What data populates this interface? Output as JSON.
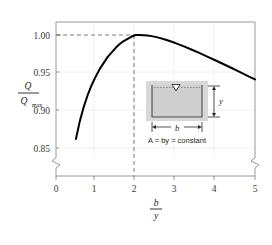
{
  "figure": {
    "caption": "(a)",
    "background_color": "#ffffff",
    "curve_color": "#000000",
    "frame_color": "#9a9a9a",
    "grid_color": "#e8e8e8",
    "dash_color": "#6e6e6e"
  },
  "axes": {
    "y_title_numerator": "Q",
    "y_title_denominator": "Q",
    "y_title_denominator_sub": "max",
    "x_title_numerator": "b",
    "x_title_denominator": "y",
    "y_ticks": [
      "1.00",
      "0.95",
      "0.90",
      "0.85"
    ],
    "x_ticks": [
      "0",
      "1",
      "2",
      "3",
      "4",
      "5"
    ],
    "y_axis_break": true,
    "x_axis_break": true
  },
  "inset": {
    "depth_label": "y",
    "width_label": "b",
    "equation": "A = by = constant",
    "water_surface_symbol": "triangle",
    "channel_fill": "#d6d6d6",
    "water_fill": "#cfcfcf"
  },
  "annotations": {
    "peak_gridline_x": "2",
    "peak_gridline_y": "1.00"
  },
  "chart_data": {
    "type": "line",
    "title": "",
    "subtitle": "",
    "xlabel": "b/y",
    "ylabel": "Q/Qmax",
    "xlim": [
      0,
      5
    ],
    "ylim": [
      0.85,
      1.005
    ],
    "grid": true,
    "legend": null,
    "annotations": [
      {
        "text": "dashed vertical at b/y = 2",
        "x": 2,
        "y": 1.0
      },
      {
        "text": "dashed horizontal at Q/Qmax = 1.00",
        "x": 0,
        "y": 1.0
      }
    ],
    "series": [
      {
        "name": "Q/Qmax vs b/y",
        "x": [
          0.5,
          0.6,
          0.7,
          0.8,
          0.9,
          1.0,
          1.1,
          1.2,
          1.3,
          1.4,
          1.5,
          1.6,
          1.7,
          1.8,
          1.9,
          2.0,
          2.1,
          2.2,
          2.3,
          2.4,
          2.5,
          2.6,
          2.8,
          3.0,
          3.2,
          3.4,
          3.6,
          3.8,
          4.0,
          4.2,
          4.4,
          4.6,
          4.8,
          5.0
        ],
        "y": [
          0.862,
          0.886,
          0.905,
          0.921,
          0.934,
          0.945,
          0.955,
          0.963,
          0.971,
          0.977,
          0.983,
          0.988,
          0.992,
          0.995,
          0.998,
          1.0,
          1.0,
          0.9998,
          0.9993,
          0.9985,
          0.9975,
          0.9962,
          0.993,
          0.9893,
          0.9852,
          0.9808,
          0.9762,
          0.9714,
          0.9665,
          0.9615,
          0.9565,
          0.9514,
          0.9462,
          0.941
        ]
      }
    ]
  }
}
